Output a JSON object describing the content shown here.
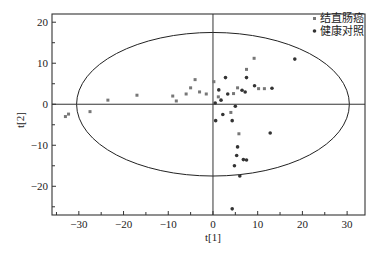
{
  "chart_data": {
    "type": "scatter",
    "title": "",
    "xlabel": "t[1]",
    "ylabel": "t[2]",
    "xlim": [
      -36,
      34
    ],
    "ylim": [
      -27,
      22
    ],
    "xticks": [
      -30,
      -20,
      -10,
      0,
      10,
      20,
      30
    ],
    "yticks": [
      -20,
      -10,
      0,
      10,
      20
    ],
    "xtick_labels": [
      "−30",
      "−20",
      "−10",
      "0",
      "10",
      "20",
      "30"
    ],
    "ytick_labels": [
      "−20",
      "−10",
      "0",
      "10",
      "20"
    ],
    "grid": false,
    "legend_position": "top-right",
    "confidence_ellipse": {
      "cx": 0,
      "cy": 0,
      "rx": 30.5,
      "ry": 17.5,
      "label": "Hotelling T2 ellipse"
    },
    "series": [
      {
        "name": "结直肠癌",
        "marker": "square",
        "color": "#777777",
        "points": [
          [
            -33,
            -3
          ],
          [
            -32.3,
            -2.4
          ],
          [
            -27.5,
            -1.8
          ],
          [
            -23.5,
            1.0
          ],
          [
            -17,
            2.2
          ],
          [
            -9,
            2.0
          ],
          [
            -8.2,
            0.8
          ],
          [
            -6,
            2.5
          ],
          [
            -5,
            4.0
          ],
          [
            -4,
            6.0
          ],
          [
            -3,
            3.0
          ],
          [
            -1.5,
            2.5
          ],
          [
            0.2,
            5.5
          ],
          [
            1.2,
            1.8
          ],
          [
            4.0,
            -2.0
          ],
          [
            4.6,
            2.6
          ],
          [
            5.5,
            4.0
          ],
          [
            5.8,
            -7.2
          ],
          [
            9.2,
            11.2
          ],
          [
            10.2,
            3.8
          ],
          [
            7.5,
            8.5
          ],
          [
            11.5,
            3.8
          ]
        ]
      },
      {
        "name": "健康对照",
        "marker": "circle",
        "color": "#333333",
        "points": [
          [
            0.5,
            0.3
          ],
          [
            1.3,
            3.5
          ],
          [
            1.8,
            1.0
          ],
          [
            2.8,
            6.5
          ],
          [
            3.3,
            2.5
          ],
          [
            4.3,
            -4.0
          ],
          [
            5.0,
            -0.5
          ],
          [
            6.5,
            3.4
          ],
          [
            7.2,
            3.0
          ],
          [
            7.5,
            6.5
          ],
          [
            9.3,
            4.5
          ],
          [
            13.2,
            3.9
          ],
          [
            18.3,
            11.0
          ],
          [
            12.8,
            -7.0
          ],
          [
            5.5,
            -10.4
          ],
          [
            5.3,
            -12.5
          ],
          [
            4.8,
            -15.0
          ],
          [
            6.8,
            -13.5
          ],
          [
            7.5,
            -13.6
          ],
          [
            6.0,
            -17.5
          ],
          [
            4.3,
            -25.5
          ],
          [
            2.2,
            -2.5
          ],
          [
            0.6,
            -4.0
          ]
        ]
      }
    ]
  },
  "legend": {
    "items": [
      {
        "label": "结直肠癌",
        "marker": "square",
        "color": "#777777"
      },
      {
        "label": "健康对照",
        "marker": "circle",
        "color": "#333333"
      }
    ]
  },
  "axes": {
    "x_title": "t[1]",
    "y_title": "t[2]"
  }
}
